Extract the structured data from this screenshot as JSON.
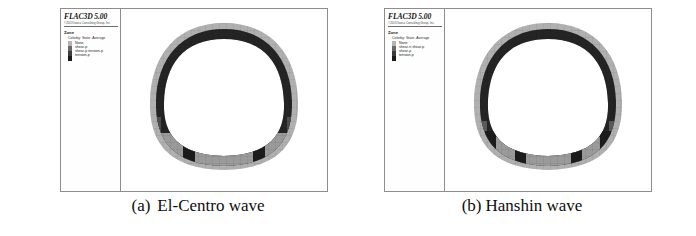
{
  "figure": {
    "background_color": "#ffffff",
    "panel_border_color": "#8d8d8d"
  },
  "colors": {
    "state_none": "#b4b4b4",
    "state_shear_p": "#6a6a6a",
    "state_shear_p_tension_p": "#3c3c3c",
    "state_tension_p": "#1a1a1a",
    "lining_outer": "#b0b0b0",
    "lining_mid": "#8f8f8f",
    "lining_dark": "#242424",
    "invert_gray": "#9a9a9a",
    "mesh_line": "#5a5a5a"
  },
  "panels": [
    {
      "id": "panel-a",
      "legend": {
        "brand_title": "FLAC3D 5.00",
        "brand_subtitle": "©2013 Itasca Consulting Group, Inc.",
        "group_title": "Zone",
        "subtitle": "Colorby: State -Average",
        "items": [
          {
            "label": "None",
            "color": "#b4b4b4"
          },
          {
            "label": "shear-p",
            "color": "#6a6a6a"
          },
          {
            "label": "shear-p tension-p",
            "color": "#3c3c3c"
          },
          {
            "label": "tension-p",
            "color": "#1a1a1a"
          }
        ]
      },
      "caption": {
        "tag": "(a)",
        "text": "El-Centro wave"
      }
    },
    {
      "id": "panel-b",
      "legend": {
        "brand_title": "FLAC3D 5.00",
        "brand_subtitle": "©2013 Itasca Consulting Group, Inc.",
        "group_title": "Zone",
        "subtitle": "Colorby: State -Average",
        "items": [
          {
            "label": "None",
            "color": "#b4b4b4"
          },
          {
            "label": "shear-n shear-p",
            "color": "#6a6a6a"
          },
          {
            "label": "shear-p",
            "color": "#3c3c3c"
          },
          {
            "label": "tension-p",
            "color": "#1a1a1a"
          }
        ]
      },
      "caption": {
        "tag": "(b)",
        "text": "Hanshin wave"
      }
    }
  ],
  "chart_data": {
    "type": "heatmap",
    "legend_position": "left-panel",
    "grid": false,
    "xlabel": "",
    "ylabel": "",
    "categories": [
      "None",
      "shear-p",
      "shear-p tension-p",
      "tension-p"
    ],
    "series": [
      {
        "name": "(a) El-Centro wave",
        "regions": [
          {
            "zone": "crown",
            "state": "tension-p",
            "value": 4
          },
          {
            "zone": "left-haunch",
            "state": "shear-p tension-p",
            "value": 3
          },
          {
            "zone": "right-haunch",
            "state": "tension-p",
            "value": 4
          },
          {
            "zone": "left-sidewall",
            "state": "shear-p",
            "value": 2
          },
          {
            "zone": "right-sidewall",
            "state": "shear-p tension-p",
            "value": 3
          },
          {
            "zone": "invert",
            "state": "shear-p",
            "value": 2
          },
          {
            "zone": "invert-left-block",
            "state": "tension-p",
            "value": 4
          },
          {
            "zone": "invert-right-block",
            "state": "tension-p",
            "value": 4
          },
          {
            "zone": "outer-ring",
            "state": "None",
            "value": 1
          }
        ],
        "dark_block_count": 2
      },
      {
        "name": "(b) Hanshin wave",
        "regions": [
          {
            "zone": "crown",
            "state": "tension-p",
            "value": 4
          },
          {
            "zone": "left-haunch",
            "state": "tension-p",
            "value": 4
          },
          {
            "zone": "right-haunch",
            "state": "tension-p",
            "value": 4
          },
          {
            "zone": "left-sidewall",
            "state": "shear-p",
            "value": 3
          },
          {
            "zone": "right-sidewall",
            "state": "shear-p",
            "value": 3
          },
          {
            "zone": "invert",
            "state": "shear-n shear-p",
            "value": 2
          },
          {
            "zone": "invert-block-1",
            "state": "tension-p",
            "value": 4
          },
          {
            "zone": "invert-block-2",
            "state": "tension-p",
            "value": 4
          },
          {
            "zone": "invert-block-3",
            "state": "tension-p",
            "value": 4
          },
          {
            "zone": "invert-block-4",
            "state": "tension-p",
            "value": 4
          },
          {
            "zone": "outer-ring",
            "state": "None",
            "value": 1
          }
        ],
        "dark_block_count": 4
      }
    ]
  }
}
